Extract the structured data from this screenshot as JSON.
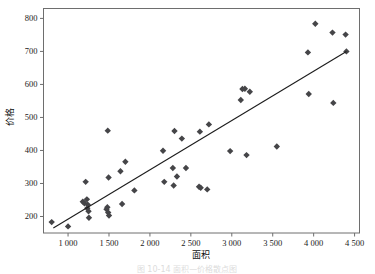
{
  "figure": {
    "caption": "图 10-14   面积—价格散点图",
    "caption_visible": false
  },
  "chart_data": {
    "type": "scatter",
    "title": "",
    "xlabel": "面积",
    "ylabel": "价格",
    "xlim": [
      700,
      4560
    ],
    "ylim": [
      150,
      830
    ],
    "xticks": [
      1000,
      1500,
      2000,
      2500,
      3000,
      3500,
      4000,
      4500
    ],
    "xticklabels": [
      "1 000",
      "1 500",
      "2 000",
      "2 500",
      "3 000",
      "3 500",
      "4 000",
      "4 500"
    ],
    "yticks": [
      200,
      300,
      400,
      500,
      600,
      700,
      800
    ],
    "yticklabels": [
      "200",
      "300",
      "400",
      "500",
      "600",
      "700",
      "800"
    ],
    "grid": false,
    "legend": null,
    "marker": "diamond",
    "marker_color": "#454548",
    "series": [
      {
        "name": "面积-价格",
        "points": [
          [
            800,
            183
          ],
          [
            1000,
            170
          ],
          [
            1180,
            245
          ],
          [
            1200,
            240
          ],
          [
            1215,
            305
          ],
          [
            1230,
            252
          ],
          [
            1235,
            225
          ],
          [
            1240,
            236
          ],
          [
            1250,
            216
          ],
          [
            1255,
            196
          ],
          [
            1470,
            222
          ],
          [
            1480,
            228
          ],
          [
            1485,
            460
          ],
          [
            1490,
            212
          ],
          [
            1495,
            318
          ],
          [
            1500,
            203
          ],
          [
            1640,
            337
          ],
          [
            1660,
            238
          ],
          [
            1700,
            366
          ],
          [
            1810,
            279
          ],
          [
            2160,
            399
          ],
          [
            2175,
            305
          ],
          [
            2280,
            347
          ],
          [
            2290,
            294
          ],
          [
            2300,
            459
          ],
          [
            2330,
            321
          ],
          [
            2390,
            436
          ],
          [
            2440,
            347
          ],
          [
            2600,
            290
          ],
          [
            2620,
            287
          ],
          [
            2700,
            282
          ],
          [
            2720,
            479
          ],
          [
            2610,
            457
          ],
          [
            2980,
            398
          ],
          [
            3110,
            553
          ],
          [
            3130,
            586
          ],
          [
            3160,
            587
          ],
          [
            3180,
            386
          ],
          [
            3220,
            578
          ],
          [
            3550,
            412
          ],
          [
            3930,
            697
          ],
          [
            3940,
            571
          ],
          [
            4020,
            784
          ],
          [
            4230,
            757
          ],
          [
            4240,
            544
          ],
          [
            4390,
            751
          ],
          [
            4400,
            700
          ]
        ]
      }
    ],
    "fit_line": {
      "name": "回归直线",
      "x": [
        820,
        4400
      ],
      "y": [
        165,
        700
      ],
      "color": "#1c1c1c"
    }
  }
}
